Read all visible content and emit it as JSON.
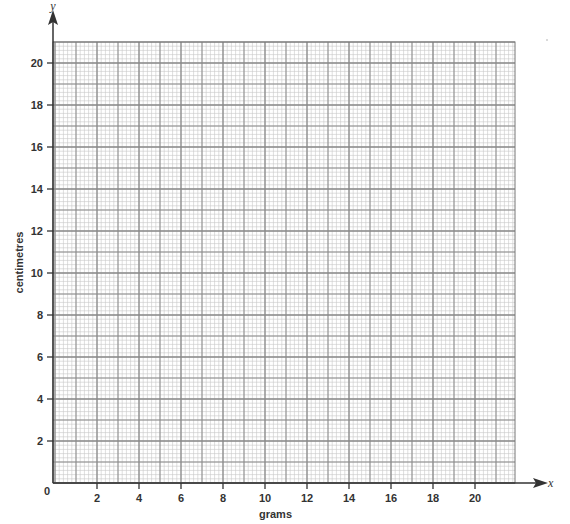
{
  "chart_data": {
    "type": "scatter",
    "title": "",
    "xlabel": "grams",
    "ylabel": "centimetres",
    "x_axis_letter": "x",
    "y_axis_letter": "y",
    "origin_label": "0",
    "xlim": [
      0,
      22
    ],
    "ylim": [
      0,
      21
    ],
    "x_ticks": [
      2,
      4,
      6,
      8,
      10,
      12,
      14,
      16,
      18,
      20
    ],
    "x_tick_labels": [
      "2",
      "4",
      "6",
      "8",
      "10",
      "12",
      "14",
      "16",
      "18",
      "20"
    ],
    "y_ticks": [
      2,
      4,
      6,
      8,
      10,
      12,
      14,
      16,
      18,
      20
    ],
    "y_tick_labels": [
      "2",
      "4",
      "6",
      "8",
      "10",
      "12",
      "14",
      "16",
      "18",
      "20"
    ],
    "grid": true,
    "grid_major_step": 1,
    "grid_minor_step": 0.2,
    "series": [],
    "colors": {
      "minor_grid": "#c8c8c8",
      "major_grid": "#8a8a8a",
      "axis": "#333333"
    }
  }
}
